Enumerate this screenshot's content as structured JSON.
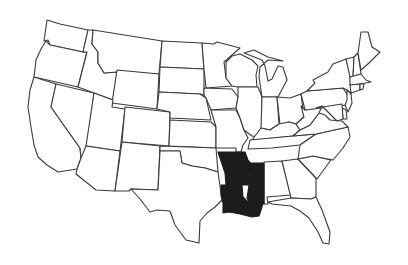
{
  "map": {
    "title": "United States outline map",
    "highlight_color": "#1c1c1c",
    "base_fill": "#ffffff",
    "stroke_color": "#3a3a3a",
    "highlighted_states": [
      "Arkansas",
      "Louisiana",
      "Mississippi"
    ],
    "states": [
      {
        "name": "Washington",
        "highlighted": false,
        "points": "47,20 60,24 88,30 83,52 50,45 48,40 44,41 46,27"
      },
      {
        "name": "Oregon",
        "highlighted": false,
        "points": "46,41 50,45 83,52 87,52 78,87 34,77 36,60 41,49"
      },
      {
        "name": "California",
        "highlighted": false,
        "points": "34,77 56,84 51,107 80,148 81,158 77,169 58,172 47,165 38,157 34,145 31,127 28,107 30,90"
      },
      {
        "name": "Nevada",
        "highlighted": false,
        "points": "56,84 94,93 86,154 81,158 80,148 51,107"
      },
      {
        "name": "Idaho",
        "highlighted": false,
        "points": "88,30 93,30 92,44 98,52 98,63 104,73 117,72 113,100 94,93 78,87 87,52 83,52"
      },
      {
        "name": "Montana",
        "highlighted": false,
        "points": "93,30 162,41 159,74 117,72 104,73 98,63 98,52 92,44"
      },
      {
        "name": "Wyoming",
        "highlighted": false,
        "points": "117,70 159,74 157,109 112,103"
      },
      {
        "name": "Utah",
        "highlighted": false,
        "points": "94,93 113,100 112,107 125,109 120,151 86,146"
      },
      {
        "name": "Colorado",
        "highlighted": false,
        "points": "125,107 170,112 169,146 122,142"
      },
      {
        "name": "Arizona",
        "highlighted": false,
        "points": "86,146 120,151 115,191 96,190 76,174 77,169 81,158"
      },
      {
        "name": "New Mexico",
        "highlighted": false,
        "points": "122,142 160,146 158,190 131,189 129,191 115,191"
      },
      {
        "name": "North Dakota",
        "highlighted": false,
        "points": "162,41 202,43 204,69 160,67"
      },
      {
        "name": "South Dakota",
        "highlighted": false,
        "points": "160,67 204,69 204,95 200,94 159,92"
      },
      {
        "name": "Nebraska",
        "highlighted": false,
        "points": "159,92 200,94 206,98 211,120 170,118 170,112 157,109"
      },
      {
        "name": "Kansas",
        "highlighted": false,
        "points": "170,120 211,122 216,127 216,148 169,146"
      },
      {
        "name": "Oklahoma",
        "highlighted": false,
        "points": "160,146 216,148 218,172 205,168 192,166 182,163 180,151 160,151"
      },
      {
        "name": "Texas",
        "highlighted": false,
        "points": "160,151 180,151 182,163 192,166 205,168 218,172 222,200 215,207 207,213 200,221 199,243 186,240 175,225 170,211 157,210 150,212 140,199 131,189 158,190"
      },
      {
        "name": "Minnesota",
        "highlighted": false,
        "points": "202,43 214,44 217,42 240,48 224,62 226,78 232,86 206,88 204,69"
      },
      {
        "name": "Iowa",
        "highlighted": false,
        "points": "204,88 232,89 238,97 236,108 211,110 206,98 204,95"
      },
      {
        "name": "Missouri",
        "highlighted": false,
        "points": "211,110 236,110 240,118 244,130 248,138 243,145 241,152 236,152 236,148 216,148 216,127"
      },
      {
        "name": "Wisconsin",
        "highlighted": false,
        "points": "226,62 232,56 240,54 252,60 258,66 256,75 257,87 238,87 232,86 226,78"
      },
      {
        "name": "Illinois",
        "highlighted": false,
        "points": "238,87 258,87 262,97 262,128 258,137 252,136 244,130 240,118 236,108 238,97"
      },
      {
        "name": "Michigan",
        "highlighted": false,
        "points": "244,53 254,50 268,57 283,61 268,60 260,67 259,77 262,97 278,97 287,80 283,67 278,66 272,79 268,81 265,66 262,60"
      },
      {
        "name": "Indiana",
        "highlighted": false,
        "points": "262,97 277,97 279,124 270,130 261,128"
      },
      {
        "name": "Ohio",
        "highlighted": false,
        "points": "277,97 290,98 301,94 304,117 296,124 289,122 280,125"
      },
      {
        "name": "Kentucky",
        "highlighted": false,
        "points": "261,128 270,130 279,124 289,122 296,124 300,130 293,136 265,139 252,140"
      },
      {
        "name": "Tennessee",
        "highlighted": false,
        "points": "250,140 293,136 316,134 300,145 272,148 248,149"
      },
      {
        "name": "Arkansas",
        "highlighted": true,
        "points": "218,152 245,152 248,160 252,165 249,175 250,185 226,185 225,173"
      },
      {
        "name": "Louisiana",
        "highlighted": true,
        "points": "221,185 242,185 243,197 247,201 263,202 262,207 259,216 252,217 240,214 229,212 223,213 223,203 221,195"
      },
      {
        "name": "Mississippi",
        "highlighted": true,
        "points": "249,163 264,163 264,204 250,204 247,198 249,185 250,175"
      },
      {
        "name": "Alabama",
        "highlighted": false,
        "points": "264,162 282,161 291,195 267,197 268,204 264,204"
      },
      {
        "name": "Georgia",
        "highlighted": false,
        "points": "282,161 298,159 316,178 316,197 311,199 291,198"
      },
      {
        "name": "Florida",
        "highlighted": false,
        "points": "268,202 291,198 311,199 316,197 322,210 330,232 329,244 323,243 318,232 309,218 300,211 291,206 272,204"
      },
      {
        "name": "South Carolina",
        "highlighted": false,
        "points": "298,159 313,156 331,160 317,179"
      },
      {
        "name": "North Carolina",
        "highlighted": false,
        "points": "300,145 316,134 348,127 350,137 343,148 333,160 313,156 298,159"
      },
      {
        "name": "Virginia",
        "highlighted": false,
        "points": "293,136 300,130 310,125 319,113 325,115 330,120 342,121 348,127 316,134"
      },
      {
        "name": "West Virginia",
        "highlighted": false,
        "points": "296,124 304,117 301,106 305,110 316,108 322,106 319,113 310,125 300,130"
      },
      {
        "name": "Pennsylvania",
        "highlighted": false,
        "points": "301,94 307,91 343,88 348,96 347,105 305,110"
      },
      {
        "name": "New York",
        "highlighted": false,
        "points": "307,91 315,83 313,80 328,72 333,64 346,59 350,75 351,94 347,90 343,88"
      },
      {
        "name": "New Jersey",
        "highlighted": false,
        "points": "347,90 351,94 352,103 348,112 345,105 347,100"
      },
      {
        "name": "Delaware",
        "highlighted": false,
        "points": "342,108 346,110 347,119 343,119"
      },
      {
        "name": "Maryland",
        "highlighted": false,
        "points": "316,108 342,104 343,119 337,121 330,114 322,106"
      },
      {
        "name": "Vermont",
        "highlighted": false,
        "points": "346,59 354,57 353,77 350,77"
      },
      {
        "name": "New Hampshire",
        "highlighted": false,
        "points": "354,57 358,53 361,74 353,77"
      },
      {
        "name": "Maine",
        "highlighted": false,
        "points": "358,53 361,32 368,32 372,47 380,52 369,63 361,70"
      },
      {
        "name": "Massachusetts",
        "highlighted": false,
        "points": "350,77 361,74 366,80 371,82 360,84 350,85"
      },
      {
        "name": "Connecticut",
        "highlighted": false,
        "points": "350,85 360,84 360,90 351,93"
      },
      {
        "name": "Rhode Island",
        "highlighted": false,
        "points": "360,84 364,84 363,89 360,90"
      }
    ]
  }
}
